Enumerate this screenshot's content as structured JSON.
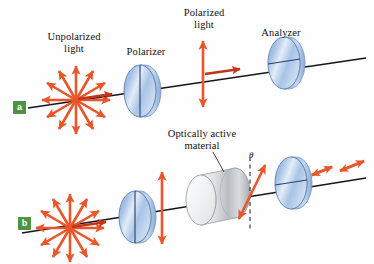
{
  "figure": {
    "background_color": "#fefefe",
    "arrow_color": "#e8562a",
    "axis_color": "#17161c",
    "disc_color": "#b9cde9",
    "material_color": "#e9ebec",
    "badge_color": "#4f9244"
  },
  "panels": [
    {
      "id": "a",
      "badge": "a",
      "badge_x": 13,
      "badge_y": 101,
      "labels": [
        {
          "name": "unpolarized-light-label",
          "text": "Unpolarized\nlight",
          "x": 28,
          "y": 31,
          "w": 92
        },
        {
          "name": "polarizer-label",
          "text": "Polarizer",
          "x": 112,
          "y": 46,
          "w": 68
        },
        {
          "name": "polarized-light-label",
          "text": "Polarized\nlight",
          "x": 168,
          "y": 7,
          "w": 72
        },
        {
          "name": "analyzer-label",
          "text": "Analyzer",
          "x": 247,
          "y": 27,
          "w": 68
        }
      ],
      "elements": {
        "unpolarized_burst": {
          "cx": 76,
          "cy": 100,
          "rays": 12,
          "length": 34
        },
        "polarizer_disc": {
          "cx": 140,
          "cy": 91,
          "rx": 16,
          "ry": 26,
          "axis": "vertical"
        },
        "polarized_arrow": {
          "x": 203,
          "cy": 74,
          "half_length": 33,
          "orientation": "vertical"
        },
        "analyzer_disc": {
          "cx": 284,
          "cy": 63,
          "rx": 16,
          "ry": 26,
          "axis": "horizontal"
        },
        "propagation_axis": {
          "x1": 28,
          "y1": 108,
          "x2": 366,
          "y2": 58
        }
      }
    },
    {
      "id": "b",
      "badge": "b",
      "badge_x": 18,
      "badge_y": 217,
      "labels": [
        {
          "name": "optically-active-material-label",
          "text": "Optically active\nmaterial",
          "x": 150,
          "y": 128,
          "w": 104
        }
      ],
      "angle_symbol": {
        "name": "theta-symbol",
        "text": "θ",
        "x": 249,
        "y": 150
      },
      "elements": {
        "unpolarized_burst": {
          "cx": 70,
          "cy": 228,
          "rays": 12,
          "length": 34
        },
        "polarizer_disc": {
          "cx": 135,
          "cy": 217,
          "rx": 16,
          "ry": 26,
          "axis": "vertical"
        },
        "polarized_arrow": {
          "x": 162,
          "cy": 208,
          "half_length": 36,
          "orientation": "vertical"
        },
        "material_cylinder": {
          "cx": 201,
          "cy": 200,
          "rx": 15,
          "ry": 25,
          "depth": 34
        },
        "rotated_arrow": {
          "cx": 252,
          "cy": 192,
          "tilt_deg": 28,
          "half_length": 30
        },
        "reference_line": {
          "x": 250,
          "y1": 156,
          "y2": 228,
          "style": "dashed"
        },
        "analyzer_disc": {
          "cx": 291,
          "cy": 183,
          "rx": 16,
          "ry": 26,
          "axis": "horizontal"
        },
        "output_arrows": [
          {
            "cx": 322,
            "cy": 171,
            "tilt_deg": -22,
            "half_length": 13
          },
          {
            "cx": 350,
            "cy": 166,
            "tilt_deg": -22,
            "half_length": 14
          }
        ],
        "propagation_axis": {
          "x1": 22,
          "y1": 233,
          "x2": 366,
          "y2": 178
        }
      }
    }
  ]
}
